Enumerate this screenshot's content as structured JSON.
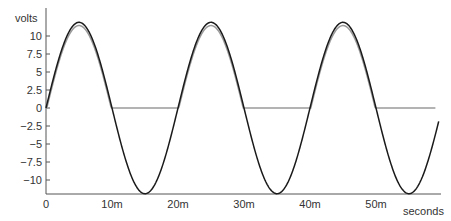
{
  "chart_data": {
    "type": "line",
    "title": "",
    "xlabel": "seconds",
    "ylabel": "volts",
    "xlim": [
      0,
      0.059
    ],
    "ylim": [
      -12.4,
      12.4
    ],
    "grid": false,
    "legend": "none",
    "x_ticks": [
      {
        "value": 0,
        "label": "0"
      },
      {
        "value": 0.01,
        "label": "10m"
      },
      {
        "value": 0.02,
        "label": "20m"
      },
      {
        "value": 0.03,
        "label": "30m"
      },
      {
        "value": 0.04,
        "label": "40m"
      },
      {
        "value": 0.05,
        "label": "50m"
      }
    ],
    "y_ticks": [
      {
        "value": 10,
        "label": "10"
      },
      {
        "value": 7.5,
        "label": "7.5"
      },
      {
        "value": 5,
        "label": "5"
      },
      {
        "value": 2.5,
        "label": "2.5"
      },
      {
        "value": 0,
        "label": "0"
      },
      {
        "value": -2.5,
        "label": "−2.5"
      },
      {
        "value": -5,
        "label": "−5"
      },
      {
        "value": -7.5,
        "label": "−7.5"
      },
      {
        "value": -10,
        "label": "−10"
      }
    ],
    "series": [
      {
        "name": "input sine",
        "color": "#1a1a1a",
        "kind": "sine",
        "amplitude": 11.9,
        "frequency_hz": 50,
        "x_end": 0.0595
      },
      {
        "name": "half-wave rectified output",
        "color": "#9a9a9a",
        "kind": "halfwave",
        "amplitude": 11.9,
        "diode_drop": 0.45,
        "frequency_hz": 50,
        "x_end": 0.059
      }
    ]
  }
}
